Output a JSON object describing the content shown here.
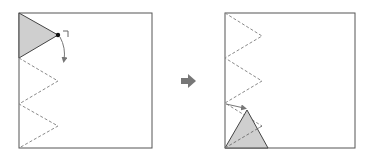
{
  "diagram": {
    "colors": {
      "paper_border": "#555555",
      "shaded_fill": "#cfcfcf",
      "shaded_stroke": "#444444",
      "dashed_line": "#8a8a8a",
      "arrow": "#777777",
      "dot": "#111111"
    },
    "left_panel": {
      "label": "before",
      "paper": {
        "x": 19,
        "y": 13,
        "width": 133,
        "height": 135
      },
      "shaded_triangle": "19,13 58,35 19,58",
      "pivot_dot": {
        "cx": 58,
        "cy": 35,
        "r": 2.2
      },
      "corner_mark": "M63,31 L68,31 L68,37",
      "fold_arrow": "M60,37 Q66,48 64,60",
      "zigzag": "19,58 58,81 19,104 58,126 19,148"
    },
    "transition_arrow": {
      "label": "right-arrow",
      "x": 181,
      "y": 81
    },
    "right_panel": {
      "label": "after",
      "paper": {
        "x": 225,
        "y": 13,
        "width": 130,
        "height": 135
      },
      "zigzag": "225,13 262,36 225,58 262,81 225,103 262,126 225,148",
      "shaded_triangle": "225,148 247,110 268,148",
      "inner_dashed": "M225,148 L262,126",
      "hint_arrow": "M226,104 L244,108"
    }
  }
}
